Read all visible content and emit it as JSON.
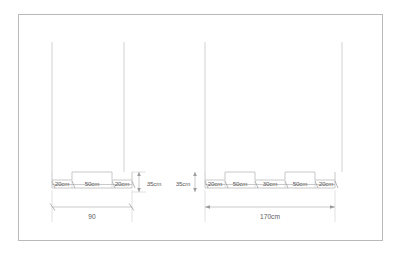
{
  "drawing": {
    "title": "Two-part stepped profile elevation with dimension chains",
    "units": "cm",
    "line_color": "#c2c2c2",
    "text_color": "#5a5a5a",
    "frame_color": "#b9b9b9",
    "background": "#ffffff"
  },
  "frame": {
    "name": "drawing-border"
  },
  "left_group": {
    "name": "left-profile-assembly",
    "overall_label": "90",
    "height_label": "35cm",
    "segments": [
      {
        "label": "20cm",
        "level": "raised"
      },
      {
        "label": "50cm",
        "level": "recessed"
      },
      {
        "label": "20cm",
        "level": "raised"
      }
    ]
  },
  "right_group": {
    "name": "right-profile-assembly",
    "overall_label": "170cm",
    "height_label": "35cm",
    "segments": [
      {
        "label": "20cm",
        "level": "raised"
      },
      {
        "label": "50cm",
        "level": "recessed"
      },
      {
        "label": "30cm",
        "level": "raised"
      },
      {
        "label": "50cm",
        "level": "recessed"
      },
      {
        "label": "20cm",
        "level": "raised"
      }
    ]
  }
}
